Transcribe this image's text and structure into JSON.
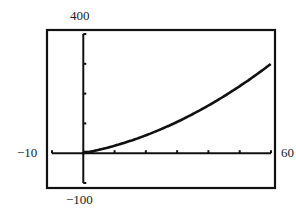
{
  "chart_data": {
    "type": "line",
    "title": "",
    "xlabel": "",
    "ylabel": "",
    "xlim": [
      -10,
      60
    ],
    "ylim": [
      -100,
      400
    ],
    "xscale": 10,
    "yscale": 100,
    "grid": false,
    "legend": null,
    "window_labels": {
      "xmin": "−10",
      "xmax": "60",
      "ymin": "−100",
      "ymax": "400"
    },
    "series": [
      {
        "name": "curve",
        "style": "pixelated-dashed",
        "x": [
          0,
          5,
          10,
          15,
          20,
          25,
          30,
          35,
          40,
          45,
          50,
          55,
          60
        ],
        "y": [
          0,
          11,
          25,
          41,
          60,
          81,
          105,
          131,
          160,
          191,
          225,
          261,
          300
        ]
      }
    ]
  },
  "colors": {
    "ink": "#111111",
    "background": "#ffffff"
  }
}
